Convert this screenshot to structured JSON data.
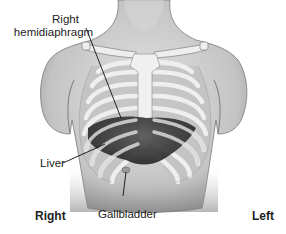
{
  "diagram": {
    "labels": {
      "right_hemidiaphragm": [
        "Right",
        "hemidiaphragm"
      ],
      "liver": "Liver",
      "gallbladder": "Gallbladder",
      "side_right": "Right",
      "side_left": "Left"
    },
    "colors": {
      "skin": "#c9c9c9",
      "skin_shadow": "#8f8f8f",
      "bone": "#eeeeee",
      "rib_band": "#b9b9b9",
      "liver": "#3a3a3a",
      "leader_line": "#111111",
      "text": "#222222"
    }
  }
}
